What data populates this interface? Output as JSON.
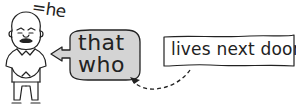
{
  "figure": {
    "person_label": "=he"
  },
  "bubble": {
    "lines": [
      "that",
      "who"
    ],
    "fill": "#d4d4d4"
  },
  "box": {
    "text": "lives next door"
  },
  "arrow": {
    "style": "dashed",
    "from": "box",
    "to": "bubble"
  }
}
